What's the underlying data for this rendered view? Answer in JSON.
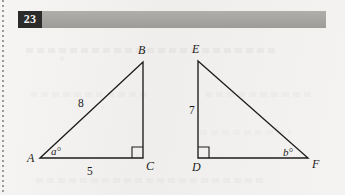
{
  "page": {
    "problem_number": "23",
    "background_color": "#f3f2f0",
    "header_bar_color": "#a6a4a1",
    "number_box_color": "#2b2b2b",
    "ink_color": "#1c1c1c"
  },
  "figure": {
    "type": "geometry-diagram",
    "triangles": [
      {
        "name": "ABC",
        "vertices": [
          {
            "label": "A",
            "x": 40,
            "y": 158
          },
          {
            "label": "B",
            "x": 143,
            "y": 62
          },
          {
            "label": "C",
            "x": 143,
            "y": 158
          }
        ],
        "right_angle_at": "C",
        "side_labels": [
          {
            "text": "8",
            "side": "AB",
            "x": 78,
            "y": 98
          },
          {
            "text": "5",
            "side": "AC",
            "x": 87,
            "y": 166
          }
        ],
        "angle_labels": [
          {
            "text": "a°",
            "at": "A",
            "x": 51,
            "y": 146
          }
        ]
      },
      {
        "name": "DEF",
        "vertices": [
          {
            "label": "E",
            "x": 198,
            "y": 61
          },
          {
            "label": "D",
            "x": 198,
            "y": 158
          },
          {
            "label": "F",
            "x": 308,
            "y": 158
          }
        ],
        "right_angle_at": "D",
        "side_labels": [
          {
            "text": "7",
            "side": "DE",
            "x": 189,
            "y": 105
          }
        ],
        "angle_labels": [
          {
            "text": "b°",
            "at": "F",
            "x": 283,
            "y": 147
          }
        ]
      }
    ],
    "vertex_label_positions": {
      "A": {
        "x": 27,
        "y": 152
      },
      "B": {
        "x": 138,
        "y": 44
      },
      "C": {
        "x": 146,
        "y": 160
      },
      "D": {
        "x": 192,
        "y": 161
      },
      "E": {
        "x": 192,
        "y": 43
      },
      "F": {
        "x": 312,
        "y": 158
      }
    }
  }
}
